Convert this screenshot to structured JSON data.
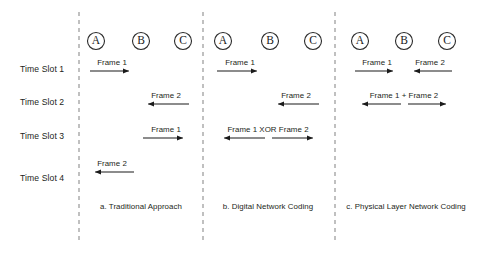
{
  "figure": {
    "width": 478,
    "height": 257,
    "background": "#ffffff",
    "ink_color": "#1a1a1a",
    "divider_color": "#8d8d8d"
  },
  "row_labels": [
    {
      "id": "slot1",
      "text": "Time Slot 1",
      "x": 20,
      "y": 64
    },
    {
      "id": "slot2",
      "text": "Time Slot 2",
      "x": 20,
      "y": 97
    },
    {
      "id": "slot3",
      "text": "Time Slot 3",
      "x": 20,
      "y": 131
    },
    {
      "id": "slot4",
      "text": "Time Slot 4",
      "x": 20,
      "y": 173
    }
  ],
  "dividers": [
    {
      "id": "divider-1",
      "x": 79,
      "y1": 12,
      "y2": 240
    },
    {
      "id": "divider-2",
      "x": 203,
      "y1": 12,
      "y2": 240
    },
    {
      "id": "divider-3",
      "x": 335,
      "y1": 12,
      "y2": 240
    }
  ],
  "panels": [
    {
      "id": "panel-a",
      "caption": "a. Traditional Approach",
      "caption_x": 141,
      "caption_y": 202,
      "nodes": [
        {
          "label": "A",
          "x": 96,
          "y": 41,
          "r": 8.5
        },
        {
          "label": "B",
          "x": 141,
          "y": 41,
          "r": 8.5
        },
        {
          "label": "C",
          "x": 183,
          "y": 41,
          "r": 8.5
        }
      ],
      "transmissions": [
        {
          "id": "a-slot1",
          "label": "Frame 1",
          "from": "A",
          "to": "B",
          "x1": 90,
          "x2": 135,
          "y": 71,
          "direction": "right",
          "label_x": 112,
          "label_y": 58
        },
        {
          "id": "a-slot2",
          "label": "Frame 2",
          "from": "C",
          "to": "B",
          "x1": 189,
          "x2": 142,
          "y": 104,
          "direction": "left",
          "label_x": 166,
          "label_y": 91
        },
        {
          "id": "a-slot3",
          "label": "Frame 1",
          "from": "B",
          "to": "C",
          "x1": 143,
          "x2": 189,
          "y": 138,
          "direction": "right",
          "label_x": 166,
          "label_y": 125
        },
        {
          "id": "a-slot4",
          "label": "Frame 2",
          "from": "B",
          "to": "A",
          "x1": 134,
          "x2": 89,
          "y": 172,
          "direction": "left",
          "label_x": 112,
          "label_y": 159
        }
      ]
    },
    {
      "id": "panel-b",
      "caption": "b. Digital Network Coding",
      "caption_x": 268,
      "caption_y": 202,
      "nodes": [
        {
          "label": "A",
          "x": 223,
          "y": 41,
          "r": 8.5
        },
        {
          "label": "B",
          "x": 270,
          "y": 41,
          "r": 8.5
        },
        {
          "label": "C",
          "x": 313,
          "y": 41,
          "r": 8.5
        }
      ],
      "transmissions": [
        {
          "id": "b-slot1",
          "label": "Frame 1",
          "from": "A",
          "to": "B",
          "x1": 217,
          "x2": 263,
          "y": 71,
          "direction": "right",
          "label_x": 240,
          "label_y": 58
        },
        {
          "id": "b-slot2",
          "label": "Frame 2",
          "from": "C",
          "to": "B",
          "x1": 319,
          "x2": 272,
          "y": 104,
          "direction": "left",
          "label_x": 296,
          "label_y": 91
        },
        {
          "id": "b-slot3a",
          "label": "",
          "from": "B",
          "to": "A",
          "x1": 265,
          "x2": 218,
          "y": 138,
          "direction": "left",
          "label_x": 0,
          "label_y": 0
        },
        {
          "id": "b-slot3b",
          "label": "",
          "from": "B",
          "to": "C",
          "x1": 272,
          "x2": 319,
          "y": 138,
          "direction": "right",
          "label_x": 0,
          "label_y": 0
        }
      ],
      "broadcast_label": {
        "text": "Frame 1 XOR Frame 2",
        "x": 268,
        "y": 125
      }
    },
    {
      "id": "panel-c",
      "caption": "c. Physical Layer Network Coding",
      "caption_x": 406,
      "caption_y": 202,
      "nodes": [
        {
          "label": "A",
          "x": 360,
          "y": 41,
          "r": 8.5
        },
        {
          "label": "B",
          "x": 404,
          "y": 41,
          "r": 8.5
        },
        {
          "label": "C",
          "x": 447,
          "y": 41,
          "r": 8.5
        }
      ],
      "transmissions": [
        {
          "id": "c-slot1a",
          "label": "Frame 1",
          "from": "A",
          "to": "B",
          "x1": 355,
          "x2": 399,
          "y": 71,
          "direction": "right",
          "label_x": 377,
          "label_y": 58
        },
        {
          "id": "c-slot1b",
          "label": "Frame 2",
          "from": "C",
          "to": "B",
          "x1": 452,
          "x2": 408,
          "y": 71,
          "direction": "left",
          "label_x": 430,
          "label_y": 58
        },
        {
          "id": "c-slot2a",
          "label": "",
          "from": "B",
          "to": "A",
          "x1": 401,
          "x2": 356,
          "y": 104,
          "direction": "left",
          "label_x": 0,
          "label_y": 0
        },
        {
          "id": "c-slot2b",
          "label": "",
          "from": "B",
          "to": "C",
          "x1": 408,
          "x2": 452,
          "y": 104,
          "direction": "right",
          "label_x": 0,
          "label_y": 0
        }
      ],
      "broadcast_label": {
        "text": "Frame 1 + Frame 2",
        "x": 404,
        "y": 91
      }
    }
  ]
}
